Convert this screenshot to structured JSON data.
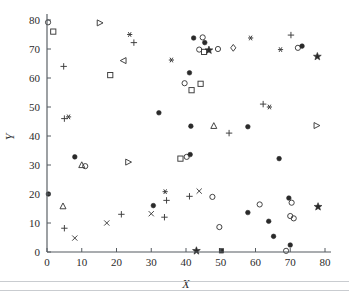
{
  "figure": {
    "background_color": "#ffffff",
    "marker_color": "#2a2a2a",
    "axis_color": "#555b60"
  },
  "axes": {
    "x_title": "X",
    "y_title": "Y",
    "x_ticks": [
      "0",
      "10",
      "20",
      "30",
      "40",
      "50",
      "60",
      "70",
      "80"
    ],
    "y_ticks": [
      "0",
      "10",
      "20",
      "30",
      "40",
      "50",
      "60",
      "70",
      "80"
    ]
  },
  "chart_data": {
    "type": "scatter",
    "title": "",
    "xlabel": "X",
    "ylabel": "Y",
    "xlim": [
      0,
      80
    ],
    "ylim": [
      0,
      80
    ],
    "xticks": [
      0,
      10,
      20,
      30,
      40,
      50,
      60,
      70,
      80
    ],
    "yticks": [
      0,
      10,
      20,
      30,
      40,
      50,
      60,
      70,
      80
    ],
    "grid": false,
    "legend": "none",
    "marker_kinds": [
      "circle-open",
      "circle-filled",
      "square-open",
      "square-filled",
      "triangle-up-open",
      "triangle-right-open",
      "triangle-left-open",
      "diamond-open",
      "plus",
      "cross",
      "star",
      "asterisk"
    ],
    "points": [
      {
        "x": 0.3,
        "y": 79.2,
        "marker": "circle-open"
      },
      {
        "x": 1.8,
        "y": 76.0,
        "marker": "square-open"
      },
      {
        "x": 15.2,
        "y": 79.0,
        "marker": "triangle-right-open"
      },
      {
        "x": 23.8,
        "y": 75.0,
        "marker": "asterisk"
      },
      {
        "x": 25.0,
        "y": 72.2,
        "marker": "plus"
      },
      {
        "x": 22.0,
        "y": 66.0,
        "marker": "triangle-left-open"
      },
      {
        "x": 35.8,
        "y": 66.2,
        "marker": "asterisk"
      },
      {
        "x": 4.8,
        "y": 64.0,
        "marker": "plus"
      },
      {
        "x": 18.2,
        "y": 61.0,
        "marker": "square-open"
      },
      {
        "x": 44.2,
        "y": 58.0,
        "marker": "square-open"
      },
      {
        "x": 5.0,
        "y": 46.0,
        "marker": "plus"
      },
      {
        "x": 6.2,
        "y": 46.6,
        "marker": "asterisk"
      },
      {
        "x": 32.2,
        "y": 48.0,
        "marker": "circle-filled"
      },
      {
        "x": 48.0,
        "y": 43.5,
        "marker": "triangle-up-open"
      },
      {
        "x": 42.2,
        "y": 73.8,
        "marker": "circle-filled"
      },
      {
        "x": 44.8,
        "y": 74.0,
        "marker": "circle-open"
      },
      {
        "x": 45.4,
        "y": 72.2,
        "marker": "circle-filled"
      },
      {
        "x": 43.8,
        "y": 69.8,
        "marker": "circle-open"
      },
      {
        "x": 45.2,
        "y": 69.0,
        "marker": "square-open"
      },
      {
        "x": 46.6,
        "y": 69.6,
        "marker": "star"
      },
      {
        "x": 49.2,
        "y": 70.0,
        "marker": "circle-open"
      },
      {
        "x": 53.6,
        "y": 70.4,
        "marker": "diamond-open"
      },
      {
        "x": 58.6,
        "y": 73.8,
        "marker": "asterisk"
      },
      {
        "x": 70.2,
        "y": 74.8,
        "marker": "plus"
      },
      {
        "x": 67.2,
        "y": 69.8,
        "marker": "asterisk"
      },
      {
        "x": 72.2,
        "y": 70.4,
        "marker": "circle-open"
      },
      {
        "x": 73.4,
        "y": 71.0,
        "marker": "circle-filled"
      },
      {
        "x": 77.8,
        "y": 67.4,
        "marker": "star"
      },
      {
        "x": 41.0,
        "y": 61.8,
        "marker": "circle-filled"
      },
      {
        "x": 39.6,
        "y": 58.2,
        "marker": "circle-open"
      },
      {
        "x": 41.6,
        "y": 55.8,
        "marker": "square-open"
      },
      {
        "x": 62.2,
        "y": 51.0,
        "marker": "plus"
      },
      {
        "x": 64.0,
        "y": 50.0,
        "marker": "asterisk"
      },
      {
        "x": 41.4,
        "y": 43.4,
        "marker": "circle-filled"
      },
      {
        "x": 52.4,
        "y": 41.0,
        "marker": "plus"
      },
      {
        "x": 57.8,
        "y": 43.2,
        "marker": "circle-filled"
      },
      {
        "x": 77.6,
        "y": 43.6,
        "marker": "triangle-right-open"
      },
      {
        "x": 41.2,
        "y": 33.6,
        "marker": "circle-filled"
      },
      {
        "x": 0.4,
        "y": 20.0,
        "marker": "circle-filled"
      },
      {
        "x": 8.0,
        "y": 32.8,
        "marker": "circle-filled"
      },
      {
        "x": 10.0,
        "y": 30.0,
        "marker": "triangle-up-open"
      },
      {
        "x": 11.0,
        "y": 29.6,
        "marker": "circle-open"
      },
      {
        "x": 23.4,
        "y": 31.0,
        "marker": "triangle-right-open"
      },
      {
        "x": 38.4,
        "y": 32.2,
        "marker": "square-open"
      },
      {
        "x": 40.2,
        "y": 32.8,
        "marker": "circle-open"
      },
      {
        "x": 66.8,
        "y": 32.2,
        "marker": "circle-filled"
      },
      {
        "x": 4.6,
        "y": 15.8,
        "marker": "triangle-up-open"
      },
      {
        "x": 5.0,
        "y": 8.2,
        "marker": "plus"
      },
      {
        "x": 8.0,
        "y": 4.8,
        "marker": "cross"
      },
      {
        "x": 17.2,
        "y": 10.0,
        "marker": "cross"
      },
      {
        "x": 21.4,
        "y": 13.0,
        "marker": "plus"
      },
      {
        "x": 30.0,
        "y": 13.2,
        "marker": "cross"
      },
      {
        "x": 30.6,
        "y": 16.0,
        "marker": "circle-filled"
      },
      {
        "x": 33.8,
        "y": 12.0,
        "marker": "plus"
      },
      {
        "x": 34.0,
        "y": 20.8,
        "marker": "asterisk"
      },
      {
        "x": 34.4,
        "y": 17.8,
        "marker": "plus"
      },
      {
        "x": 41.0,
        "y": 19.2,
        "marker": "plus"
      },
      {
        "x": 43.8,
        "y": 21.0,
        "marker": "cross"
      },
      {
        "x": 47.6,
        "y": 19.0,
        "marker": "circle-open"
      },
      {
        "x": 49.6,
        "y": 8.6,
        "marker": "circle-open"
      },
      {
        "x": 57.8,
        "y": 13.6,
        "marker": "circle-filled"
      },
      {
        "x": 61.2,
        "y": 16.4,
        "marker": "circle-open"
      },
      {
        "x": 63.8,
        "y": 10.6,
        "marker": "circle-filled"
      },
      {
        "x": 65.2,
        "y": 5.4,
        "marker": "circle-filled"
      },
      {
        "x": 69.6,
        "y": 18.6,
        "marker": "circle-filled"
      },
      {
        "x": 70.4,
        "y": 17.0,
        "marker": "circle-open"
      },
      {
        "x": 70.0,
        "y": 12.4,
        "marker": "circle-open"
      },
      {
        "x": 71.0,
        "y": 11.6,
        "marker": "circle-open"
      },
      {
        "x": 78.0,
        "y": 15.6,
        "marker": "star"
      },
      {
        "x": 43.0,
        "y": 0.4,
        "marker": "star"
      },
      {
        "x": 50.2,
        "y": 0.4,
        "marker": "square-filled"
      },
      {
        "x": 68.8,
        "y": 0.4,
        "marker": "circle-open"
      },
      {
        "x": 70.0,
        "y": 2.4,
        "marker": "circle-filled"
      },
      {
        "x": 12.0,
        "y": 0.6,
        "marker": "none"
      }
    ]
  }
}
